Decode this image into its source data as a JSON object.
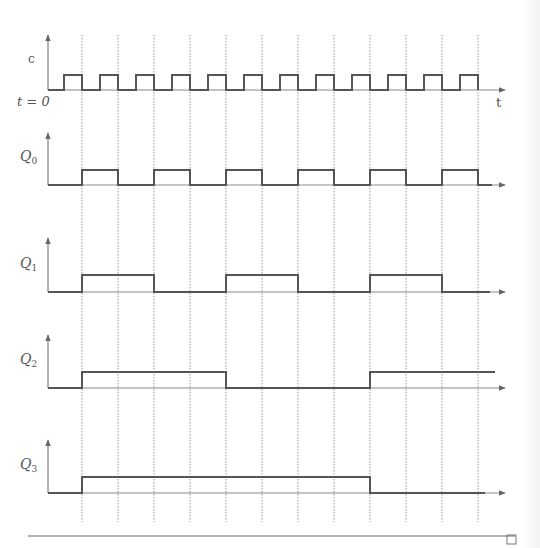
{
  "figure": {
    "type": "timing-diagram",
    "time_axis_label": "t",
    "origin_label": "t = 0",
    "end_marker": "□"
  },
  "colors": {
    "signal": "#555555",
    "axis": "#8a8a8a",
    "gridline": "#9a9a9a",
    "rule": "#999999"
  },
  "geometry": {
    "x_start": 48,
    "x_end": 505,
    "first_edge": 82,
    "period_px": 36,
    "gridlines_x": [
      82,
      118,
      154,
      190,
      226,
      262,
      298,
      334,
      370,
      406,
      442,
      478
    ],
    "grid_top": 35,
    "grid_bottom": 522
  },
  "signals": [
    {
      "id": "clock",
      "label": "c",
      "label_sub": "",
      "baseline_y": 90,
      "high_y": 75,
      "axis_top": 35,
      "draw_end": 478,
      "segments": [
        [
          48,
          0
        ],
        [
          64,
          1
        ],
        [
          82,
          0
        ],
        [
          100,
          1
        ],
        [
          118,
          0
        ],
        [
          136,
          1
        ],
        [
          154,
          0
        ],
        [
          172,
          1
        ],
        [
          190,
          0
        ],
        [
          208,
          1
        ],
        [
          226,
          0
        ],
        [
          244,
          1
        ],
        [
          262,
          0
        ],
        [
          280,
          1
        ],
        [
          298,
          0
        ],
        [
          316,
          1
        ],
        [
          334,
          0
        ],
        [
          352,
          1
        ],
        [
          370,
          0
        ],
        [
          388,
          1
        ],
        [
          406,
          0
        ],
        [
          424,
          1
        ],
        [
          442,
          0
        ],
        [
          460,
          1
        ],
        [
          478,
          0
        ]
      ]
    },
    {
      "id": "q0",
      "label": "Q",
      "label_sub": "0",
      "baseline_y": 185,
      "high_y": 170,
      "axis_top": 133,
      "draw_end": 492,
      "segments": [
        [
          48,
          0
        ],
        [
          82,
          1
        ],
        [
          118,
          0
        ],
        [
          154,
          1
        ],
        [
          190,
          0
        ],
        [
          226,
          1
        ],
        [
          262,
          0
        ],
        [
          298,
          1
        ],
        [
          334,
          0
        ],
        [
          370,
          1
        ],
        [
          406,
          0
        ],
        [
          442,
          1
        ],
        [
          478,
          0
        ],
        [
          492,
          0
        ]
      ]
    },
    {
      "id": "q1",
      "label": "Q",
      "label_sub": "1",
      "baseline_y": 292,
      "high_y": 275,
      "axis_top": 238,
      "draw_end": 490,
      "segments": [
        [
          48,
          0
        ],
        [
          82,
          1
        ],
        [
          154,
          0
        ],
        [
          226,
          1
        ],
        [
          298,
          0
        ],
        [
          370,
          1
        ],
        [
          442,
          0
        ],
        [
          490,
          0
        ]
      ]
    },
    {
      "id": "q2",
      "label": "Q",
      "label_sub": "2",
      "baseline_y": 388,
      "high_y": 372,
      "axis_top": 335,
      "draw_end": 495,
      "segments": [
        [
          48,
          0
        ],
        [
          82,
          1
        ],
        [
          226,
          0
        ],
        [
          370,
          1
        ],
        [
          495,
          1
        ]
      ]
    },
    {
      "id": "q3",
      "label": "Q",
      "label_sub": "3",
      "baseline_y": 493,
      "high_y": 477,
      "axis_top": 440,
      "draw_end": 485,
      "segments": [
        [
          48,
          0
        ],
        [
          82,
          1
        ],
        [
          370,
          0
        ],
        [
          485,
          0
        ]
      ]
    }
  ],
  "chart_data": {
    "type": "line",
    "title": "",
    "xlabel": "t",
    "ylabel": "",
    "x_origin_label": "t = 0",
    "grid": "vertical dotted lines at each clock falling edge",
    "x": [
      0,
      1,
      2,
      3,
      4,
      5,
      6,
      7,
      8,
      9,
      10,
      11,
      12
    ],
    "series": [
      {
        "name": "c (clock)",
        "description": "square wave, period 1, high for second half of each period",
        "values": [
          0,
          0,
          0,
          0,
          0,
          0,
          0,
          0,
          0,
          0,
          0,
          0,
          0
        ]
      },
      {
        "name": "Q0",
        "values": [
          0,
          1,
          0,
          1,
          0,
          1,
          0,
          1,
          0,
          1,
          0,
          1,
          0
        ]
      },
      {
        "name": "Q1",
        "values": [
          0,
          1,
          1,
          0,
          0,
          1,
          1,
          0,
          0,
          1,
          1,
          0,
          0
        ]
      },
      {
        "name": "Q2",
        "values": [
          0,
          1,
          1,
          1,
          1,
          0,
          0,
          0,
          0,
          1,
          1,
          1,
          1
        ]
      },
      {
        "name": "Q3",
        "values": [
          0,
          1,
          1,
          1,
          1,
          1,
          1,
          1,
          1,
          0,
          0,
          0,
          0
        ]
      }
    ]
  }
}
